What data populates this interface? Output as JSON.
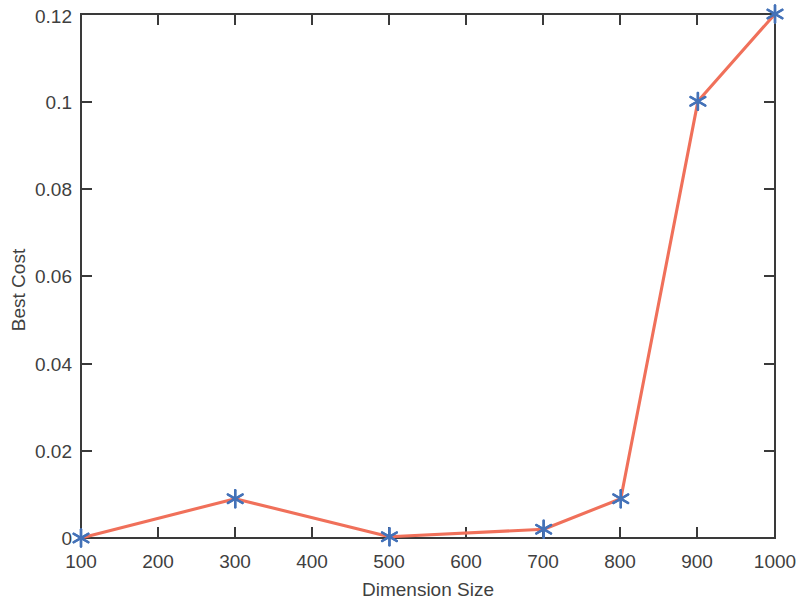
{
  "chart_data": {
    "type": "line",
    "title": "",
    "subtitle": "",
    "xlabel": "Dimension Size",
    "ylabel": "Best Cost",
    "x": [
      100,
      300,
      500,
      700,
      800,
      900,
      1000
    ],
    "values": [
      0.0,
      0.009,
      0.0003,
      0.002,
      0.009,
      0.1,
      0.12
    ],
    "series": [
      {
        "name": "Best Cost",
        "x": [
          100,
          300,
          500,
          700,
          800,
          900,
          1000
        ],
        "values": [
          0.0,
          0.009,
          0.0003,
          0.002,
          0.009,
          0.1,
          0.12
        ]
      }
    ],
    "xlim": [
      100,
      1000
    ],
    "ylim": [
      0,
      0.12
    ],
    "xticks": [
      100,
      200,
      300,
      400,
      500,
      600,
      700,
      800,
      900,
      1000
    ],
    "xtick_labels": [
      "100",
      "200",
      "300",
      "400",
      "500",
      "600",
      "700",
      "800",
      "900",
      "1000"
    ],
    "yticks": [
      0,
      0.02,
      0.04,
      0.06,
      0.08,
      0.1,
      0.12
    ],
    "ytick_labels": [
      "0",
      "0.02",
      "0.04",
      "0.06",
      "0.08",
      "0.1",
      "0.12"
    ],
    "grid": false,
    "legend": null,
    "legend_position": "none",
    "line_color": "#F0705A",
    "marker_color": "#4472B8",
    "marker_style": "asterisk",
    "axis_color": "#3A3A3A",
    "background_color": "#FFFFFF",
    "annotations": []
  },
  "figure": {
    "ylabel": "Best Cost",
    "xlabel": "Dimension Size"
  }
}
